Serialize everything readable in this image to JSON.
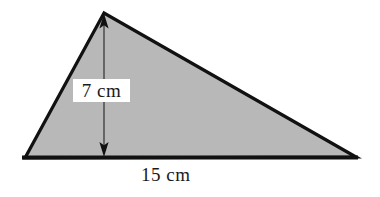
{
  "figure": {
    "kind": "geometry-triangle-diagram",
    "background_color": "#ffffff",
    "fill_color": "#b8b8b8",
    "stroke_color": "#111111",
    "text_color": "#1a1a1a",
    "shape": {
      "name": "triangle",
      "vertices": [
        {
          "name": "apex",
          "x": 104,
          "y": 13
        },
        {
          "name": "bottom-left",
          "x": 25,
          "y": 158
        },
        {
          "name": "bottom-right",
          "x": 356,
          "y": 157
        }
      ]
    },
    "dimensions": {
      "height": {
        "label": "7 cm",
        "value": 7,
        "unit": "cm",
        "orientation": "vertical",
        "line_x": 104,
        "line_top_y": 16,
        "line_bottom_y": 155,
        "arrowheads": "both"
      },
      "base": {
        "label": "15 cm",
        "value": 15,
        "unit": "cm",
        "orientation": "horizontal",
        "line_y": 157
      }
    }
  }
}
